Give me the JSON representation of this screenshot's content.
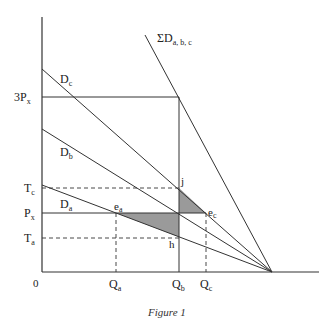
{
  "diagram": {
    "caption": "Figure 1",
    "origin_label": "0",
    "y_labels": {
      "three_px": {
        "main": "3P",
        "sub": "x"
      },
      "tc": {
        "main": "T",
        "sub": "c"
      },
      "px": {
        "main": "P",
        "sub": "x"
      },
      "ta": {
        "main": "T",
        "sub": "a"
      }
    },
    "x_labels": {
      "qa": {
        "main": "Q",
        "sub": "a"
      },
      "qb": {
        "main": "Q",
        "sub": "b"
      },
      "qc": {
        "main": "Q",
        "sub": "c"
      }
    },
    "curves": {
      "dc": {
        "main": "D",
        "sub": "c"
      },
      "db": {
        "main": "D",
        "sub": "b"
      },
      "da": {
        "main": "D",
        "sub": "a"
      },
      "sum": {
        "main": "ΣD",
        "sub": "a, b, c"
      }
    },
    "points": {
      "ea": {
        "main": "e",
        "sub": "a"
      },
      "ec": {
        "main": "e",
        "sub": "c"
      },
      "j": {
        "main": "j"
      },
      "h": {
        "main": "h"
      }
    },
    "colors": {
      "line": "#333333",
      "shade": "#9a9a9a"
    }
  }
}
